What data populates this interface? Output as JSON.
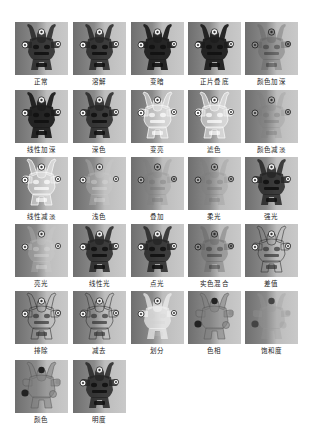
{
  "tiles": [
    {
      "label": "正常",
      "style": "normal"
    },
    {
      "label": "溶解",
      "style": "normal"
    },
    {
      "label": "变暗",
      "style": "dark"
    },
    {
      "label": "正片叠底",
      "style": "dark"
    },
    {
      "label": "颜色加深",
      "style": "faint-dark"
    },
    {
      "label": "线性加深",
      "style": "dark"
    },
    {
      "label": "深色",
      "style": "normal"
    },
    {
      "label": "变亮",
      "style": "light"
    },
    {
      "label": "滤色",
      "style": "light"
    },
    {
      "label": "颜色减淡",
      "style": "faint"
    },
    {
      "label": "线性减淡",
      "style": "light"
    },
    {
      "label": "浅色",
      "style": "light-faint"
    },
    {
      "label": "叠加",
      "style": "faint"
    },
    {
      "label": "柔光",
      "style": "faint"
    },
    {
      "label": "强光",
      "style": "normal"
    },
    {
      "label": "亮光",
      "style": "light-faint"
    },
    {
      "label": "线性光",
      "style": "normal"
    },
    {
      "label": "点光",
      "style": "normal"
    },
    {
      "label": "实色混合",
      "style": "faint-dark"
    },
    {
      "label": "差值",
      "style": "outline"
    },
    {
      "label": "排除",
      "style": "outline"
    },
    {
      "label": "减去",
      "style": "outline"
    },
    {
      "label": "划分",
      "style": "silhouette-light"
    },
    {
      "label": "色相",
      "style": "blob"
    },
    {
      "label": "饱和度",
      "style": "blob-faint"
    },
    {
      "label": "颜色",
      "style": "blob"
    },
    {
      "label": "明度",
      "style": "normal"
    }
  ]
}
